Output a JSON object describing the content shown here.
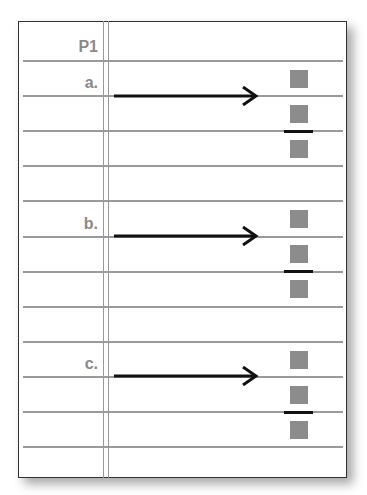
{
  "header": {
    "label": "P1"
  },
  "rows": [
    {
      "label": "a.",
      "arrow": "right-arrow",
      "squares": 3,
      "divider": "between-square-2-and-3"
    },
    {
      "label": "b.",
      "arrow": "right-arrow",
      "squares": 3,
      "divider": "between-square-2-and-3"
    },
    {
      "label": "c.",
      "arrow": "right-arrow",
      "squares": 3,
      "divider": "between-square-2-and-3"
    }
  ],
  "colors": {
    "square": "#8c8c8c",
    "rule": "#9a9a9a",
    "label": "#8a8a8a",
    "arrow": "#111111"
  }
}
